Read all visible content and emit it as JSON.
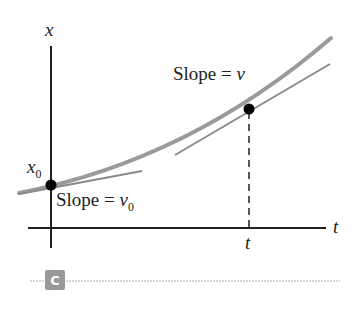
{
  "diagram": {
    "axes": {
      "y_label": "x",
      "x_label": "t",
      "x_tick_label": "t",
      "y_intercept_label": "x",
      "y_intercept_sub": "0"
    },
    "annotations": {
      "slope_top_prefix": "Slope = ",
      "slope_top_var": "v",
      "slope_bottom_prefix": "Slope = ",
      "slope_bottom_var": "v",
      "slope_bottom_sub": "0"
    },
    "panel_badge": "C",
    "colors": {
      "axis": "#231f20",
      "curve": "#9a9a9a",
      "tangent": "#8a8a8a",
      "point": "#000000",
      "badge": "#999999",
      "rule": "#c8c8c8"
    }
  }
}
